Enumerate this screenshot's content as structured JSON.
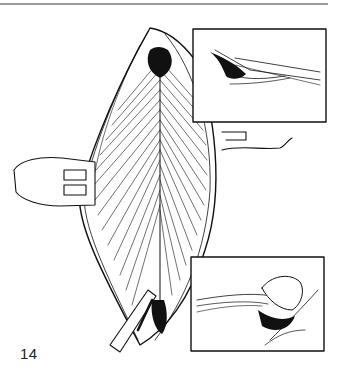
{
  "page": {
    "rule_color": "#9a9a9a",
    "figure_number": "14"
  },
  "figure": {
    "main_illustration": "open-incision-with-retracted-muscle-layers",
    "inset_top": "cross-section-instrument-under-fascia",
    "inset_bottom": "cross-section-finger-dissection",
    "ink_color": "#111111",
    "paper_color": "#ffffff"
  }
}
